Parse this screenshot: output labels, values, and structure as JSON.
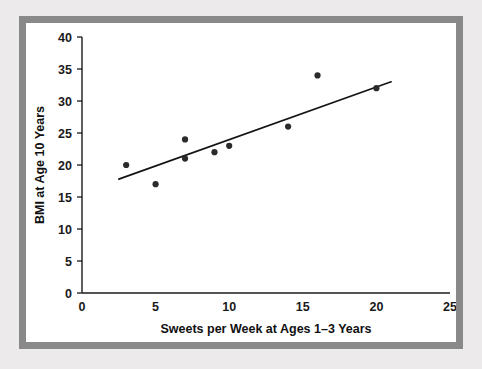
{
  "chart_data": {
    "type": "scatter",
    "title": "",
    "xlabel": "Sweets per Week at Ages 1–3 Years",
    "ylabel": "BMI at Age 10 Years",
    "xlim": [
      0,
      25
    ],
    "ylim": [
      0,
      40
    ],
    "xticks": [
      0,
      5,
      10,
      15,
      20,
      25
    ],
    "yticks": [
      0,
      5,
      10,
      15,
      20,
      25,
      30,
      35,
      40
    ],
    "xtick_labels": [
      "0",
      "5",
      "10",
      "15",
      "20",
      "25"
    ],
    "ytick_labels": [
      "0",
      "5",
      "10",
      "15",
      "20",
      "25",
      "30",
      "35",
      "40"
    ],
    "grid": false,
    "legend": false,
    "point_color": "#2b2b2b",
    "line_color": "#141414",
    "points": [
      {
        "x": 3,
        "y": 20
      },
      {
        "x": 5,
        "y": 17
      },
      {
        "x": 7,
        "y": 24
      },
      {
        "x": 7,
        "y": 21
      },
      {
        "x": 9,
        "y": 22
      },
      {
        "x": 10,
        "y": 23
      },
      {
        "x": 14,
        "y": 26
      },
      {
        "x": 16,
        "y": 34
      },
      {
        "x": 20,
        "y": 32
      }
    ],
    "trendline": {
      "x0": 2.5,
      "y0": 17.8,
      "x1": 21.0,
      "y1": 33.0
    }
  },
  "figure": {
    "border_color": "#898989",
    "background_color": "#eceaea",
    "plot_background": "#ffffff"
  }
}
